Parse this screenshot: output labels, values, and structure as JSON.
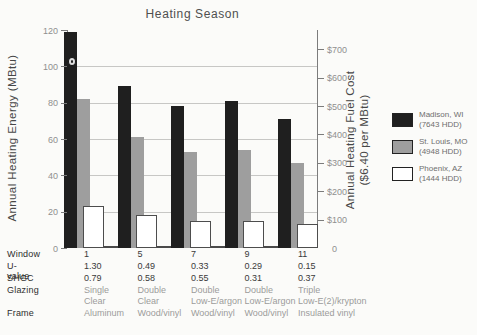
{
  "title": "Heating Season",
  "y_axis": {
    "label": "Annual Heating Energy (MBtu)",
    "ticks": [
      {
        "label": "120",
        "value": 120
      },
      {
        "label": "100",
        "value": 100
      },
      {
        "label": "80",
        "value": 80
      },
      {
        "label": "60",
        "value": 60
      },
      {
        "label": "40",
        "value": 40
      },
      {
        "label": "20",
        "value": 20
      },
      {
        "label": "0",
        "value": 0
      }
    ]
  },
  "y2_axis": {
    "label_line1": "Annual Heating Fuel Cost",
    "label_line2": "($6.40 per MBtu)",
    "ticks": [
      {
        "label": "$700",
        "value": 700
      },
      {
        "label": "$600",
        "value": 600
      },
      {
        "label": "$500",
        "value": 500
      },
      {
        "label": "$400",
        "value": 400
      },
      {
        "label": "$300",
        "value": 300
      },
      {
        "label": "$200",
        "value": 200
      },
      {
        "label": "$100",
        "value": 100
      },
      {
        "label": "0",
        "value": 0
      }
    ]
  },
  "legend": {
    "items": [
      {
        "name": "Madison, WI",
        "detail": "(7643 HDD)",
        "color": "#1f1f1f"
      },
      {
        "name": "St. Louis, MO",
        "detail": "(4948 HDD)",
        "color": "#9e9e9e"
      },
      {
        "name": "Phoenix, AZ",
        "detail": "(1444 HDD)",
        "color": "#ffffff"
      }
    ]
  },
  "table": {
    "rows": [
      {
        "label": "Window",
        "muted": false,
        "values": [
          [
            "1"
          ],
          [
            "5"
          ],
          [
            "7"
          ],
          [
            "9"
          ],
          [
            "11"
          ]
        ]
      },
      {
        "label": "U-value",
        "muted": false,
        "values": [
          [
            "1.30"
          ],
          [
            "0.49"
          ],
          [
            "0.33"
          ],
          [
            "0.29"
          ],
          [
            "0.15"
          ]
        ]
      },
      {
        "label": "SHGC",
        "muted": false,
        "values": [
          [
            "0.79"
          ],
          [
            "0.58"
          ],
          [
            "0.55"
          ],
          [
            "0.31"
          ],
          [
            "0.37"
          ]
        ]
      },
      {
        "label": "Glazing",
        "muted": true,
        "values": [
          [
            "Single",
            "Clear"
          ],
          [
            "Double",
            "Clear"
          ],
          [
            "Double",
            "Low-E/argon"
          ],
          [
            "Double",
            "Low-E/argon"
          ],
          [
            "Triple",
            "Low-E(2)/krypton"
          ]
        ]
      },
      {
        "label": "Frame",
        "muted": true,
        "values": [
          [
            "Aluminum"
          ],
          [
            "Wood/vinyl"
          ],
          [
            "Wood/vinyl"
          ],
          [
            "Wood/vinyl"
          ],
          [
            "Insulated vinyl"
          ]
        ]
      }
    ]
  },
  "chart_data": {
    "type": "bar",
    "title": "Heating Season",
    "categories": [
      "1",
      "5",
      "7",
      "9",
      "11"
    ],
    "series": [
      {
        "name": "Madison, WI (7643 HDD)",
        "color": "#1f1f1f",
        "values": [
          119,
          89,
          78,
          81,
          71
        ]
      },
      {
        "name": "St. Louis, MO (4948 HDD)",
        "color": "#9e9e9e",
        "values": [
          82,
          61,
          53,
          54,
          47
        ]
      },
      {
        "name": "Phoenix, AZ (1444 HDD)",
        "color": "#ffffff",
        "values": [
          23,
          18,
          15,
          15,
          13
        ]
      }
    ],
    "xlabel": "Window",
    "ylabel": "Annual Heating Energy (MBtu)",
    "y2label": "Annual Heating Fuel Cost ($6.40 per MBtu)",
    "ylim": [
      0,
      120
    ],
    "y2lim": [
      0,
      768
    ],
    "cost_per_mbtu": 6.4,
    "gridlines_y": [
      20,
      40,
      60,
      80,
      100
    ],
    "grid": true,
    "legend_position": "right"
  }
}
